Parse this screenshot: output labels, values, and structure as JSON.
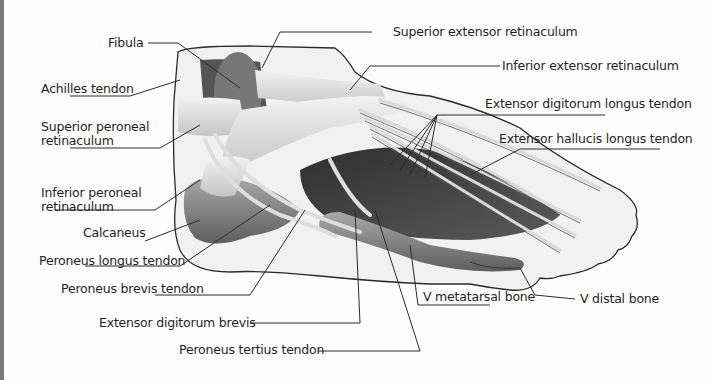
{
  "diagram": {
    "colors": {
      "background": "#fdfdfd",
      "outline": "#2a2a2a",
      "skin_fill": "#f1f1f1",
      "muscle_dark": "#3d3d3d",
      "muscle_mid": "#6b6b6b",
      "bone": "#8a8a8a",
      "tendon_light": "#e6e6e6",
      "leader_line": "#2b2b2b",
      "text": "#1f1f1f"
    },
    "labels": {
      "fibula": "Fibula",
      "achilles_tendon": "Achilles tendon",
      "superior_peroneal_retinaculum_1": "Superior peroneal",
      "superior_peroneal_retinaculum_2": "retinaculum",
      "inferior_peroneal_retinaculum_1": "Inferior peroneal",
      "inferior_peroneal_retinaculum_2": "retinaculum",
      "calcaneus": "Calcaneus",
      "peroneus_longus_tendon": "Peroneus longus tendon",
      "peroneus_brevis_tendon": "Peroneus brevis tendon",
      "extensor_digitorum_brevis": "Extensor digitorum brevis",
      "peroneus_tertius_tendon": "Peroneus tertius tendon",
      "superior_extensor_retinaculum": "Superior extensor retinaculum",
      "inferior_extensor_retinaculum": "Inferior extensor retinaculum",
      "extensor_digitorum_longus_tendon": "Extensor digitorum longus tendon",
      "extensor_hallucis_longus_tendon": "Extensor hallucis longus tendon",
      "v_metatarsal_bone": "V metatarsal  bone",
      "v_distal_bone": "V distal bone"
    }
  }
}
